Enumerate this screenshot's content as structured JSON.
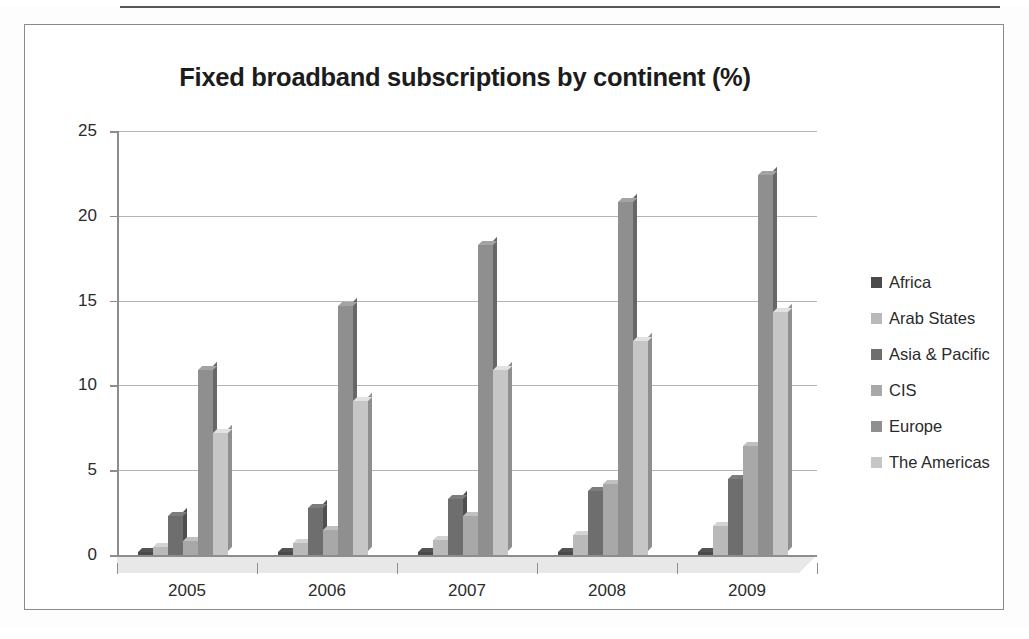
{
  "frame": {
    "border_color": "#8a8a8a",
    "background": "#ffffff"
  },
  "chart_data": {
    "type": "bar",
    "title": "Fixed broadband subscriptions by continent (%)",
    "xlabel": "",
    "ylabel": "",
    "ylim": [
      0,
      25
    ],
    "yticks": [
      0,
      5,
      10,
      15,
      20,
      25
    ],
    "ytick_labels": [
      "0",
      "5",
      "10",
      "15",
      "20",
      "25"
    ],
    "grid": true,
    "legend_position": "right",
    "style": "3d-clustered-column",
    "categories": [
      "2005",
      "2006",
      "2007",
      "2008",
      "2009"
    ],
    "series": [
      {
        "name": "Africa",
        "color": "#4a4a4a",
        "values": [
          0.2,
          0.2,
          0.2,
          0.2,
          0.2
        ]
      },
      {
        "name": "Arab States",
        "color": "#b9b9b9",
        "values": [
          0.5,
          0.7,
          0.9,
          1.2,
          1.7
        ]
      },
      {
        "name": "Asia & Pacific",
        "color": "#6e6e6e",
        "values": [
          2.3,
          2.8,
          3.3,
          3.8,
          4.5
        ]
      },
      {
        "name": "CIS",
        "color": "#a8a8a8",
        "values": [
          0.8,
          1.5,
          2.3,
          4.2,
          6.4
        ]
      },
      {
        "name": "Europe",
        "color": "#8f8f8f",
        "values": [
          10.9,
          14.7,
          18.3,
          20.8,
          22.4
        ]
      },
      {
        "name": "The Americas",
        "color": "#c6c6c6",
        "values": [
          7.2,
          9.1,
          10.9,
          12.6,
          14.3
        ]
      }
    ]
  },
  "legend": {
    "items": [
      {
        "label": "Africa",
        "color": "#4a4a4a"
      },
      {
        "label": "Arab States",
        "color": "#b9b9b9"
      },
      {
        "label": "Asia & Pacific",
        "color": "#6e6e6e"
      },
      {
        "label": "CIS",
        "color": "#a8a8a8"
      },
      {
        "label": "Europe",
        "color": "#8f8f8f"
      },
      {
        "label": "The Americas",
        "color": "#c6c6c6"
      }
    ]
  }
}
